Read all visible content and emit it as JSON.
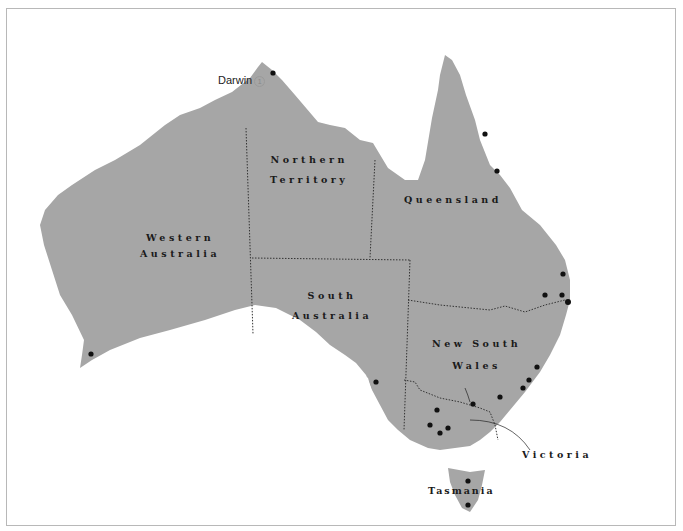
{
  "map": {
    "title": "Australia sustainability ranking map",
    "colors": {
      "land": "#a6a6a6",
      "sea": "#ffffff",
      "border": "#333333",
      "dot": "#111111"
    },
    "states": [
      {
        "id": "wa",
        "line1": "Western",
        "line2": "Australia"
      },
      {
        "id": "nt",
        "line1": "Northern",
        "line2": "Territory"
      },
      {
        "id": "qld",
        "line1": "Queensland",
        "line2": ""
      },
      {
        "id": "sa",
        "line1": "South",
        "line2": "Australia"
      },
      {
        "id": "nsw",
        "line1": "New South",
        "line2": "Wales"
      },
      {
        "id": "vic",
        "line1": "Victoria",
        "line2": ""
      },
      {
        "id": "tas",
        "line1": "Tasmania",
        "line2": ""
      }
    ],
    "cities": [
      {
        "name": "Darwin",
        "rank": "1"
      },
      {
        "name": "Sunshine Coast",
        "rank": "2"
      },
      {
        "name": "Brisbane",
        "rank": "3"
      },
      {
        "name": "Townsville",
        "rank": "4"
      },
      {
        "name": "Canberra–",
        "name2": "Queanbeyan",
        "rank": "5"
      },
      {
        "name": "Hobart",
        "rank": "6"
      },
      {
        "name": "Melbourne",
        "rank": "7"
      },
      {
        "name": "Gold Coast–",
        "name2": "Tweed Heads",
        "rank": "8"
      },
      {
        "name": "Cairns",
        "rank": "9"
      },
      {
        "name": "Bendigo",
        "rank": "10"
      },
      {
        "name": "Toowoomba",
        "rank": "11"
      },
      {
        "name": "Sydney",
        "rank": "12"
      },
      {
        "name": "Launceston",
        "rank": "13"
      },
      {
        "name": "Adelaide",
        "rank": "14"
      },
      {
        "name": "Ballarat",
        "rank": "14"
      },
      {
        "name": "Albury–Wodonga",
        "rank": "15"
      },
      {
        "name": "Wollongong",
        "rank": "16"
      },
      {
        "name": "Newcastle",
        "rank": "17"
      },
      {
        "name": "Geelong",
        "rank": "18"
      },
      {
        "name": "Perth",
        "rank": "19"
      }
    ]
  },
  "legend": {
    "title": "Key",
    "symbol": "1",
    "label": "Sustainability ranking"
  },
  "compass": {
    "n": "N",
    "s": "S",
    "e": "E",
    "w": "W"
  },
  "scale": {
    "labels": [
      "0",
      "500",
      "1000 km"
    ]
  }
}
